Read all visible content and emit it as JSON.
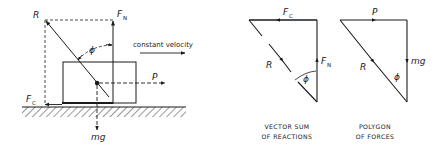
{
  "free_body_diagram": {
    "labels": {
      "resultant": "R",
      "normal_force": "F",
      "normal_force_sub": "N",
      "friction_force": "F",
      "friction_force_sub": "C",
      "angle": "ϕ",
      "push_force": "P",
      "weight": "mg",
      "motion": "constant velocity"
    }
  },
  "vector_sum": {
    "labels": {
      "top": "F",
      "top_sub": "C",
      "side": "F",
      "side_sub": "N",
      "hyp": "R",
      "angle": "ϕ"
    },
    "caption_line1": "VECTOR SUM",
    "caption_line2": "OF REACTIONS"
  },
  "polygon": {
    "labels": {
      "top": "P",
      "side": "mg",
      "hyp": "R",
      "angle": "ϕ"
    },
    "caption_line1": "POLYGON",
    "caption_line2": "OF FORCES"
  },
  "colors": {
    "ink": "#1a1a1a",
    "background": "#ffffff"
  }
}
